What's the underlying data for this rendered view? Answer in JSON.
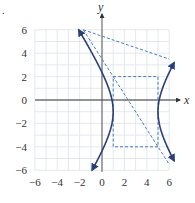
{
  "figure_marker": ".",
  "chart_data": {
    "type": "line",
    "title": "",
    "xlabel": "x",
    "ylabel": "y",
    "xlim": [
      -6,
      6
    ],
    "ylim": [
      -6,
      6
    ],
    "grid": true,
    "grid_step": 1,
    "x_ticks": [
      -6,
      -4,
      -2,
      0,
      2,
      4,
      6
    ],
    "y_ticks": [
      -6,
      -4,
      -2,
      0,
      2,
      4,
      6
    ],
    "x_tick_labels": [
      "−6",
      "−4",
      "−2",
      "0",
      "2",
      "4",
      "6"
    ],
    "y_tick_labels": [
      "−6",
      "−4",
      "−2",
      "0",
      "2",
      "4",
      "6"
    ],
    "equation": "(x-3)^2/4 - (y+1)^2/9 = 1",
    "center": [
      3,
      -1
    ],
    "a": 2,
    "b": 3,
    "vertices": [
      [
        1,
        -1
      ],
      [
        5,
        -1
      ]
    ],
    "series": [
      {
        "name": "hyperbola-left-branch",
        "style": "solid",
        "arrows": true,
        "points": [
          [
            -2.08,
            6
          ],
          [
            -1.0,
            4.4
          ],
          [
            0.0,
            2.6
          ],
          [
            0.5,
            1.3
          ],
          [
            1.0,
            -1
          ],
          [
            0.5,
            -3.3
          ],
          [
            0.0,
            -4.6
          ],
          [
            -0.89,
            -6
          ]
        ]
      },
      {
        "name": "hyperbola-right-branch",
        "style": "solid",
        "arrows": true,
        "points": [
          [
            6.1,
            3.2
          ],
          [
            5.5,
            1.5
          ],
          [
            5.0,
            -1
          ],
          [
            5.5,
            -3.5
          ],
          [
            6.1,
            -5.2
          ]
        ]
      },
      {
        "name": "asymptote-1",
        "style": "dashed",
        "equation": "y + 1 = 1.5(x - 3)",
        "points": [
          [
            -1.67,
            6
          ],
          [
            6,
            3.5
          ]
        ]
      },
      {
        "name": "asymptote-2",
        "style": "dashed",
        "equation": "y + 1 = -1.5(x - 3)",
        "points": [
          [
            -1.67,
            6
          ],
          [
            6,
            -5.5
          ]
        ]
      },
      {
        "name": "fundamental-rectangle",
        "style": "dashed",
        "points": [
          [
            1,
            2
          ],
          [
            5,
            2
          ],
          [
            5,
            -4
          ],
          [
            1,
            -4
          ],
          [
            1,
            2
          ]
        ]
      }
    ],
    "colors": {
      "curve": "#2b3f7a",
      "dashed": "#4a7bbf",
      "grid": "#dde3ea",
      "axis": "#333333"
    }
  }
}
